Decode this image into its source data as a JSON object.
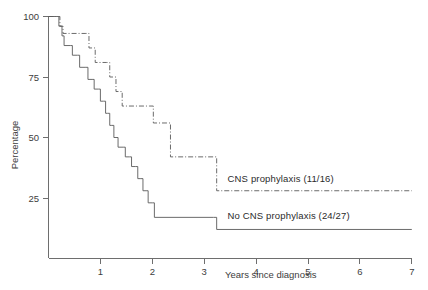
{
  "chart_data": {
    "type": "line",
    "title": "",
    "subtitle": "",
    "xlabel": "Years since diagnosis",
    "ylabel": "Percentage",
    "xlim": [
      0,
      7
    ],
    "ylim": [
      0,
      100
    ],
    "xticks": [
      1,
      2,
      3,
      4,
      5,
      6,
      7
    ],
    "xtick_labels": [
      "1",
      "2",
      "3",
      "4",
      "5",
      "6",
      "7"
    ],
    "yticks": [
      25,
      50,
      75,
      100
    ],
    "ytick_labels": [
      "25",
      "50",
      "75",
      "100"
    ],
    "grid": false,
    "legend_position": "inline-right",
    "step_style": "post",
    "series": [
      {
        "name": "CNS prophylaxis (11/16)",
        "label": "CNS prophylaxis (11/16)",
        "linestyle": "dashdot",
        "color": "#5a5a5a",
        "label_x": 3.45,
        "label_y": 31.5,
        "points": [
          {
            "x": 0.0,
            "y": 100
          },
          {
            "x": 0.18,
            "y": 100
          },
          {
            "x": 0.22,
            "y": 96
          },
          {
            "x": 0.28,
            "y": 93
          },
          {
            "x": 0.72,
            "y": 93
          },
          {
            "x": 0.78,
            "y": 87
          },
          {
            "x": 0.9,
            "y": 81
          },
          {
            "x": 1.12,
            "y": 81
          },
          {
            "x": 1.18,
            "y": 75
          },
          {
            "x": 1.3,
            "y": 69
          },
          {
            "x": 1.42,
            "y": 63
          },
          {
            "x": 1.95,
            "y": 63
          },
          {
            "x": 2.02,
            "y": 56
          },
          {
            "x": 2.28,
            "y": 56
          },
          {
            "x": 2.35,
            "y": 42
          },
          {
            "x": 3.18,
            "y": 42
          },
          {
            "x": 3.24,
            "y": 28
          },
          {
            "x": 7.0,
            "y": 28
          }
        ]
      },
      {
        "name": "No CNS prophylaxis (24/27)",
        "label": "No CNS prophylaxis (24/27)",
        "linestyle": "solid",
        "color": "#5a5a5a",
        "label_x": 3.45,
        "label_y": 16.5,
        "points": [
          {
            "x": 0.0,
            "y": 100
          },
          {
            "x": 0.16,
            "y": 100
          },
          {
            "x": 0.2,
            "y": 96
          },
          {
            "x": 0.26,
            "y": 92
          },
          {
            "x": 0.3,
            "y": 88
          },
          {
            "x": 0.42,
            "y": 88
          },
          {
            "x": 0.46,
            "y": 84
          },
          {
            "x": 0.56,
            "y": 84
          },
          {
            "x": 0.6,
            "y": 79
          },
          {
            "x": 0.72,
            "y": 79
          },
          {
            "x": 0.76,
            "y": 74
          },
          {
            "x": 0.84,
            "y": 74
          },
          {
            "x": 0.88,
            "y": 70
          },
          {
            "x": 0.96,
            "y": 70
          },
          {
            "x": 1.0,
            "y": 65
          },
          {
            "x": 1.06,
            "y": 65
          },
          {
            "x": 1.1,
            "y": 60
          },
          {
            "x": 1.14,
            "y": 60
          },
          {
            "x": 1.18,
            "y": 55
          },
          {
            "x": 1.22,
            "y": 55
          },
          {
            "x": 1.26,
            "y": 50
          },
          {
            "x": 1.3,
            "y": 50
          },
          {
            "x": 1.34,
            "y": 46
          },
          {
            "x": 1.44,
            "y": 46
          },
          {
            "x": 1.48,
            "y": 42
          },
          {
            "x": 1.56,
            "y": 42
          },
          {
            "x": 1.6,
            "y": 38
          },
          {
            "x": 1.68,
            "y": 38
          },
          {
            "x": 1.72,
            "y": 33
          },
          {
            "x": 1.78,
            "y": 33
          },
          {
            "x": 1.82,
            "y": 28
          },
          {
            "x": 1.88,
            "y": 28
          },
          {
            "x": 1.92,
            "y": 23
          },
          {
            "x": 2.0,
            "y": 23
          },
          {
            "x": 2.04,
            "y": 17
          },
          {
            "x": 3.18,
            "y": 17
          },
          {
            "x": 3.24,
            "y": 12
          },
          {
            "x": 7.0,
            "y": 12
          }
        ]
      }
    ]
  },
  "axes": {
    "y_title": "Percentage",
    "x_title": "Years since diagnosis"
  }
}
